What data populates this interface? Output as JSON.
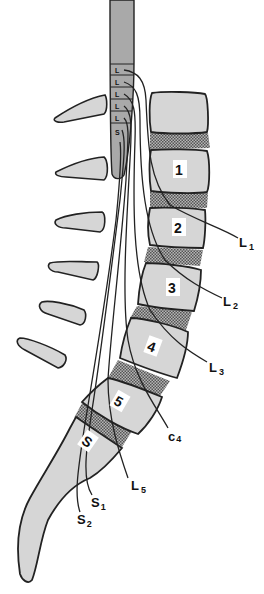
{
  "diagram": {
    "colors": {
      "bone": "#d6d6d6",
      "outline": "#222222",
      "disc": "#8a8a8a",
      "cord": "#a9a9a9",
      "background": "#ffffff"
    },
    "vertebra_labels": [
      "1",
      "2",
      "3",
      "4",
      "5",
      "S"
    ],
    "nerve_root_labels": [
      {
        "main": "L",
        "sub": "1"
      },
      {
        "main": "L",
        "sub": "2"
      },
      {
        "main": "L",
        "sub": "3"
      },
      {
        "main": "c",
        "sub": "4"
      },
      {
        "main": "L",
        "sub": "5"
      },
      {
        "main": "S",
        "sub": "1"
      },
      {
        "main": "S",
        "sub": "2"
      }
    ],
    "spinous_process_count": 6,
    "cord_segment_marks": [
      "L",
      "L",
      "L",
      "L",
      "L",
      "S"
    ]
  }
}
